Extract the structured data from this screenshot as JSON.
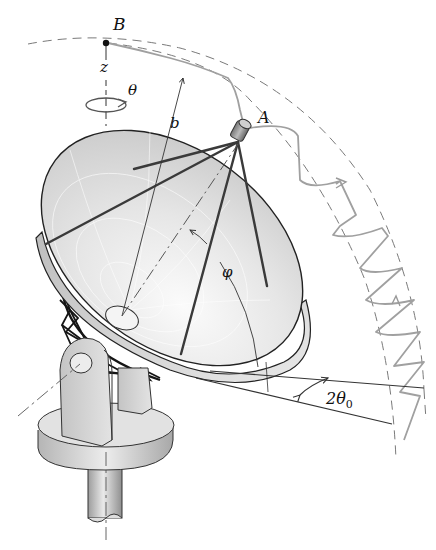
{
  "figure": {
    "labels": {
      "point_b": "B",
      "point_a": "A",
      "axis_z": "z",
      "rotation_theta": "θ",
      "radius_b": "b",
      "angle_phi": "φ",
      "cone_angle": "2θ",
      "cone_angle_subscript": "0"
    },
    "colors": {
      "ink": "#111111",
      "dish_fill": "#d9d9d9",
      "dish_light": "#f2f2f2",
      "path_gray": "#9a9a9a",
      "dashed": "#777777",
      "truss": "#1a1a1a",
      "mount_fill": "#cfcfcf"
    }
  }
}
